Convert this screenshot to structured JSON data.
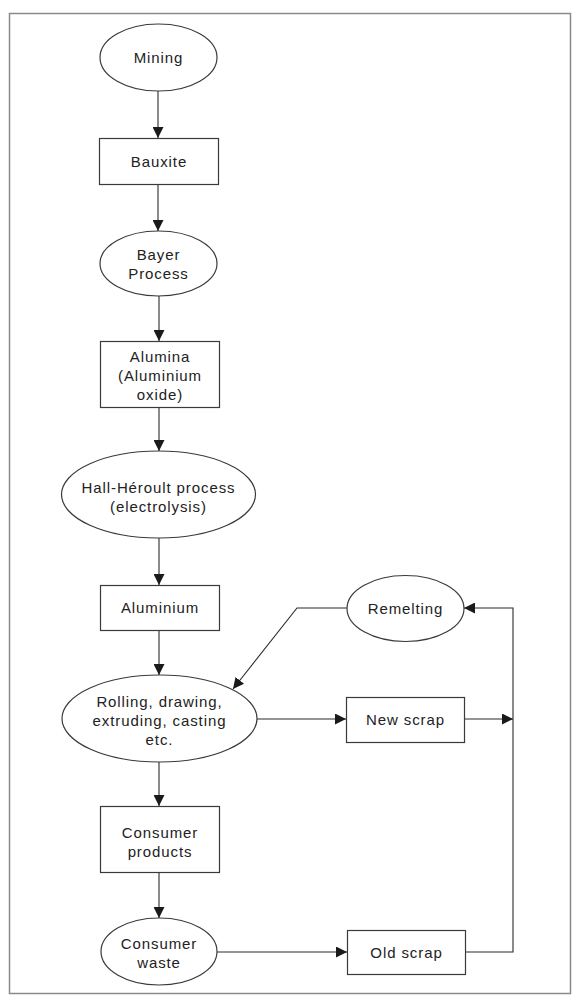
{
  "diagram": {
    "type": "flowchart",
    "colors": {
      "stroke": "#3a3a3a",
      "frame": "#8a8a8a",
      "text": "#222222",
      "background": "#ffffff"
    },
    "nodes": {
      "mining": {
        "shape": "ellipse",
        "lines": [
          "Mining"
        ]
      },
      "bauxite": {
        "shape": "rectangle",
        "lines": [
          "Bauxite"
        ]
      },
      "bayer": {
        "shape": "ellipse",
        "lines": [
          "Bayer",
          "Process"
        ]
      },
      "alumina": {
        "shape": "rectangle",
        "lines": [
          "Alumina",
          "(Aluminium",
          "oxide)"
        ]
      },
      "hall": {
        "shape": "ellipse",
        "lines": [
          "Hall-Héroult process",
          "(electrolysis)"
        ]
      },
      "aluminium": {
        "shape": "rectangle",
        "lines": [
          "Aluminium"
        ]
      },
      "rolling": {
        "shape": "ellipse",
        "lines": [
          "Rolling, drawing,",
          "extruding, casting",
          "etc."
        ]
      },
      "consumer_products": {
        "shape": "rectangle",
        "lines": [
          "Consumer",
          "products"
        ]
      },
      "consumer_waste": {
        "shape": "ellipse",
        "lines": [
          "Consumer",
          "waste"
        ]
      },
      "remelting": {
        "shape": "ellipse",
        "lines": [
          "Remelting"
        ]
      },
      "new_scrap": {
        "shape": "rectangle",
        "lines": [
          "New scrap"
        ]
      },
      "old_scrap": {
        "shape": "rectangle",
        "lines": [
          "Old scrap"
        ]
      }
    },
    "edges": [
      {
        "from": "Mining",
        "to": "Bauxite"
      },
      {
        "from": "Bauxite",
        "to": "Bayer Process"
      },
      {
        "from": "Bayer Process",
        "to": "Alumina (Aluminium oxide)"
      },
      {
        "from": "Alumina (Aluminium oxide)",
        "to": "Hall-Héroult process (electrolysis)"
      },
      {
        "from": "Hall-Héroult process (electrolysis)",
        "to": "Aluminium"
      },
      {
        "from": "Aluminium",
        "to": "Rolling, drawing, extruding, casting etc."
      },
      {
        "from": "Rolling, drawing, extruding, casting etc.",
        "to": "Consumer products"
      },
      {
        "from": "Consumer products",
        "to": "Consumer waste"
      },
      {
        "from": "Rolling, drawing, extruding, casting etc.",
        "to": "New scrap"
      },
      {
        "from": "Consumer waste",
        "to": "Old scrap"
      },
      {
        "from": "New scrap",
        "to": "Remelting"
      },
      {
        "from": "Old scrap",
        "to": "Remelting"
      },
      {
        "from": "Remelting",
        "to": "Rolling, drawing, extruding, casting etc."
      }
    ]
  }
}
